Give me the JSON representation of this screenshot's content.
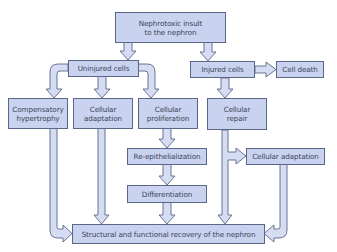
{
  "diagram": {
    "type": "flowchart",
    "colors": {
      "box_fill": "#c9d3ef",
      "box_border": "#5a6788",
      "arrow_fill": "#d6ddf3",
      "arrow_stroke": "#5a6788",
      "text": "#3a4358"
    },
    "nodes": {
      "insult": {
        "label": "Nephrotoxic insult\nto the nephron"
      },
      "uninjured": {
        "label": "Uninjured cells"
      },
      "injured": {
        "label": "Injured cells"
      },
      "cell_death": {
        "label": "Cell death"
      },
      "compensatory": {
        "label": "Compensatory\nhypertrophy"
      },
      "adaptation_left": {
        "label": "Cellular\nadaptation"
      },
      "proliferation": {
        "label": "Cellular\nproliferation"
      },
      "repair": {
        "label": "Cellular\nrepair"
      },
      "reepithelialization": {
        "label": "Re-epithelialization"
      },
      "adaptation_right": {
        "label": "Cellular adaptation"
      },
      "differentiation": {
        "label": "Differentiation"
      },
      "recovery": {
        "label": "Structural and functional recovery of the nephron"
      }
    },
    "edges": [
      [
        "insult",
        "uninjured"
      ],
      [
        "insult",
        "injured"
      ],
      [
        "injured",
        "cell_death"
      ],
      [
        "uninjured",
        "compensatory"
      ],
      [
        "uninjured",
        "adaptation_left"
      ],
      [
        "uninjured",
        "proliferation"
      ],
      [
        "injured",
        "repair"
      ],
      [
        "proliferation",
        "reepithelialization"
      ],
      [
        "reepithelialization",
        "differentiation"
      ],
      [
        "repair",
        "adaptation_right"
      ],
      [
        "compensatory",
        "recovery"
      ],
      [
        "adaptation_left",
        "recovery"
      ],
      [
        "differentiation",
        "recovery"
      ],
      [
        "repair",
        "recovery"
      ],
      [
        "adaptation_right",
        "recovery"
      ]
    ]
  }
}
